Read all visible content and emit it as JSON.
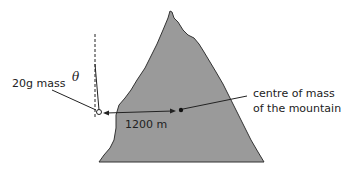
{
  "diagram": {
    "labels": {
      "mass": "20g mass",
      "angle": "θ",
      "distance": "1200 m",
      "centre_line1": "centre of mass",
      "centre_line2": "of the mountain"
    },
    "colors": {
      "mountain_fill": "#9a9a9a",
      "mountain_stroke": "#333333",
      "line": "#222222"
    }
  }
}
